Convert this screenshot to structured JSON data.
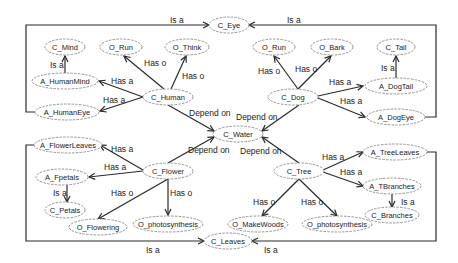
{
  "diagram": {
    "type": "ontology-graph",
    "nodes": [
      {
        "id": "C_Eye",
        "label": "C_Eye",
        "x": 229,
        "y": 25,
        "rx": 20,
        "ry": 8
      },
      {
        "id": "C_Mind",
        "label": "C_Mind",
        "x": 65,
        "y": 47,
        "rx": 20,
        "ry": 8
      },
      {
        "id": "O_Run_h",
        "label": "O_Run",
        "x": 121,
        "y": 47,
        "rx": 21,
        "ry": 8
      },
      {
        "id": "O_Think",
        "label": "O_Think",
        "x": 187,
        "y": 47,
        "rx": 22,
        "ry": 8
      },
      {
        "id": "O_Run_d",
        "label": "O_Run",
        "x": 274,
        "y": 47,
        "rx": 21,
        "ry": 8
      },
      {
        "id": "O_Bark",
        "label": "O_Bark",
        "x": 332,
        "y": 47,
        "rx": 21,
        "ry": 8
      },
      {
        "id": "C_Tail",
        "label": "C_Tail",
        "x": 396,
        "y": 47,
        "rx": 19,
        "ry": 8
      },
      {
        "id": "A_HumanMind",
        "label": "A_HumanMind",
        "x": 65,
        "y": 81,
        "rx": 33,
        "ry": 8
      },
      {
        "id": "C_Human",
        "label": "C_Human",
        "x": 168,
        "y": 97,
        "rx": 25,
        "ry": 8
      },
      {
        "id": "C_Dog",
        "label": "C_Dog",
        "x": 293,
        "y": 97,
        "rx": 25,
        "ry": 8
      },
      {
        "id": "A_DogTail",
        "label": "A_DogTail",
        "x": 396,
        "y": 86,
        "rx": 31,
        "ry": 8
      },
      {
        "id": "A_HumanEye",
        "label": "A_HumanEye",
        "x": 67,
        "y": 112,
        "rx": 32,
        "ry": 8
      },
      {
        "id": "A_DogEye",
        "label": "A_DogEye",
        "x": 396,
        "y": 117,
        "rx": 29,
        "ry": 8
      },
      {
        "id": "C_Water",
        "label": "C_Water",
        "x": 238,
        "y": 134,
        "rx": 25,
        "ry": 8
      },
      {
        "id": "A_FlowerLeaves",
        "label": "A_FlowerLeaves",
        "x": 68,
        "y": 145,
        "rx": 34,
        "ry": 8
      },
      {
        "id": "A_TreeLeaves",
        "label": "A_TreeLeaves",
        "x": 395,
        "y": 152,
        "rx": 32,
        "ry": 8
      },
      {
        "id": "A_Fpetals",
        "label": "A_Fpetals",
        "x": 62,
        "y": 177,
        "rx": 26,
        "ry": 8
      },
      {
        "id": "C_Flower",
        "label": "C_Flower",
        "x": 168,
        "y": 171,
        "rx": 25,
        "ry": 8
      },
      {
        "id": "C_Tree",
        "label": "C_Tree",
        "x": 299,
        "y": 171,
        "rx": 25,
        "ry": 8
      },
      {
        "id": "A_TBranches",
        "label": "A_TBranches",
        "x": 392,
        "y": 186,
        "rx": 29,
        "ry": 8
      },
      {
        "id": "C_Petals",
        "label": "C_Petals",
        "x": 65,
        "y": 210,
        "rx": 20,
        "ry": 8
      },
      {
        "id": "C_Branches",
        "label": "C_Branches",
        "x": 392,
        "y": 215,
        "rx": 27,
        "ry": 8
      },
      {
        "id": "O_Flowering",
        "label": "O_Flowering",
        "x": 98,
        "y": 227,
        "rx": 29,
        "ry": 8
      },
      {
        "id": "O_photosynthesis_f",
        "label": "O_photosynthesis",
        "x": 168,
        "y": 224,
        "rx": 35,
        "ry": 8
      },
      {
        "id": "O_MakeWoods",
        "label": "O_MakeWoods",
        "x": 258,
        "y": 224,
        "rx": 30,
        "ry": 8
      },
      {
        "id": "O_photosynthesis_t",
        "label": "O_photosynthesis",
        "x": 337,
        "y": 224,
        "rx": 35,
        "ry": 8
      },
      {
        "id": "C_Leaves",
        "label": "C_Leaves",
        "x": 228,
        "y": 241,
        "rx": 24,
        "ry": 8
      }
    ],
    "edges": [
      {
        "from": "A_HumanEye",
        "to": "C_Eye",
        "label": "Is a",
        "path": "M35,112 L26,112 L26,25 L209,25",
        "lx": 170,
        "ly": 23
      },
      {
        "from": "A_DogEye",
        "to": "C_Eye",
        "label": "Is a",
        "path": "M425,117 L436,117 L436,25 L249,25",
        "lx": 287,
        "ly": 23
      },
      {
        "from": "A_HumanMind",
        "to": "C_Mind",
        "label": "Is a",
        "path": "M65,73 L65,56",
        "lx": 50,
        "ly": 68
      },
      {
        "from": "C_Human",
        "to": "O_Run_h",
        "label": "Has o",
        "path": "M164,89 L124,56",
        "lx": 144,
        "ly": 66
      },
      {
        "from": "C_Human",
        "to": "O_Think",
        "label": "Has o",
        "path": "M171,89 L186,56",
        "lx": 182,
        "ly": 79
      },
      {
        "from": "C_Human",
        "to": "A_HumanMind",
        "label": "Has a",
        "path": "M143,97 L99,81",
        "lx": 111,
        "ly": 84
      },
      {
        "from": "C_Human",
        "to": "A_HumanEye",
        "label": "Has a",
        "path": "M143,97 L100,111",
        "lx": 103,
        "ly": 103
      },
      {
        "from": "C_Human",
        "to": "C_Water",
        "label": "Depend on",
        "path": "M168,105 L214,131",
        "lx": 189,
        "ly": 116
      },
      {
        "from": "C_Dog",
        "to": "O_Run_d",
        "label": "Has o",
        "path": "M298,89 L274,56",
        "lx": 258,
        "ly": 74
      },
      {
        "from": "C_Dog",
        "to": "O_Bark",
        "label": "Has o",
        "path": "M298,89 L331,56",
        "lx": 295,
        "ly": 72
      },
      {
        "from": "C_Tail",
        "to": "A_DogTail",
        "label": "Is a",
        "path": "M396,78 L396,56",
        "lx": 381,
        "ly": 71
      },
      {
        "from": "C_Dog",
        "to": "A_DogTail",
        "label": "Has a",
        "path": "M318,96 L363,86",
        "lx": 329,
        "ly": 85
      },
      {
        "from": "C_Dog",
        "to": "A_DogEye",
        "label": "Has a",
        "path": "M318,98 L365,117",
        "lx": 340,
        "ly": 104
      },
      {
        "from": "C_Dog",
        "to": "C_Water",
        "label": "Depend on",
        "path": "M299,105 L262,131",
        "lx": 236,
        "ly": 120
      },
      {
        "from": "C_Flower",
        "to": "C_Water",
        "label": "Depend on",
        "path": "M168,163 L214,137",
        "lx": 188,
        "ly": 153
      },
      {
        "from": "C_Tree",
        "to": "C_Water",
        "label": "Depend on",
        "path": "M299,163 L262,137",
        "lx": 240,
        "ly": 154
      },
      {
        "from": "C_Flower",
        "to": "A_FlowerLeaves",
        "label": "Has a",
        "path": "M143,170 L100,145",
        "lx": 111,
        "ly": 152
      },
      {
        "from": "C_Flower",
        "to": "A_Fpetals",
        "label": "Has a",
        "path": "M143,171 L89,177",
        "lx": 104,
        "ly": 170
      },
      {
        "from": "A_Fpetals",
        "to": "C_Petals",
        "label": "Is a",
        "path": "M67,185 L67,202",
        "lx": 53,
        "ly": 196
      },
      {
        "from": "C_Flower",
        "to": "O_Flowering",
        "label": "Has o",
        "path": "M168,179 L98,219",
        "lx": 111,
        "ly": 196
      },
      {
        "from": "C_Flower",
        "to": "O_photosynthesis_f",
        "label": "Has o",
        "path": "M168,179 L168,215",
        "lx": 170,
        "ly": 196
      },
      {
        "from": "A_FlowerLeaves",
        "to": "C_Leaves",
        "label": "Is a",
        "path": "M35,145 L26,145 L26,241 L204,241",
        "lx": 146,
        "ly": 253
      },
      {
        "from": "C_Tree",
        "to": "A_TreeLeaves",
        "label": "Has a",
        "path": "M323,170 L363,152",
        "lx": 322,
        "ly": 160
      },
      {
        "from": "C_Tree",
        "to": "A_TBranches",
        "label": "Has a",
        "path": "M323,172 L363,186",
        "lx": 340,
        "ly": 175
      },
      {
        "from": "A_TBranches",
        "to": "C_Branches",
        "label": "Is a",
        "path": "M392,194 L392,207",
        "lx": 401,
        "ly": 205
      },
      {
        "from": "C_Tree",
        "to": "O_MakeWoods",
        "label": "Has o",
        "path": "M299,179 L262,216",
        "lx": 253,
        "ly": 205
      },
      {
        "from": "C_Tree",
        "to": "O_photosynthesis_t",
        "label": "Has o",
        "path": "M299,179 L337,216",
        "lx": 301,
        "ly": 205
      },
      {
        "from": "A_TreeLeaves",
        "to": "C_Leaves",
        "label": "Is a",
        "path": "M427,152 L436,152 L436,241 L252,241",
        "lx": 264,
        "ly": 253
      }
    ]
  }
}
